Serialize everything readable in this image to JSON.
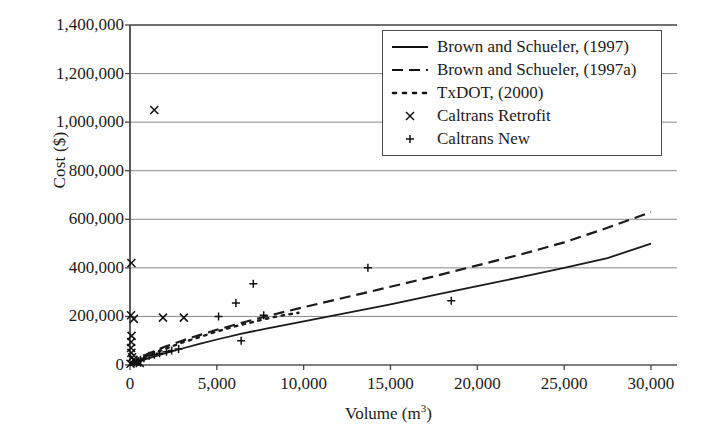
{
  "chart_data": {
    "type": "scatter",
    "title": "",
    "xlabel": "Volume (m3)",
    "xlabel_base": "Volume (m",
    "xlabel_sup": "3",
    "xlabel_tail": ")",
    "ylabel": "Cost ($)",
    "xlim": [
      0,
      31500
    ],
    "ylim": [
      0,
      1400000
    ],
    "grid": "horizontal",
    "xticks": [
      0,
      5000,
      10000,
      15000,
      20000,
      25000,
      30000
    ],
    "xticklabels": [
      "0",
      "5,000",
      "10,000",
      "15,000",
      "20,000",
      "25,000",
      "30,000"
    ],
    "yticks": [
      0,
      200000,
      400000,
      600000,
      800000,
      1000000,
      1200000,
      1400000
    ],
    "yticklabels": [
      "0",
      "200,000",
      "400,000",
      "600,000",
      "800,000",
      "1,000,000",
      "1,200,000",
      "1,400,000"
    ],
    "legend_position": "upper right",
    "legend_entries": [
      {
        "label": "Brown and Schueler, (1997)",
        "style": "solid"
      },
      {
        "label": "Brown and Schueler, (1997a)",
        "style": "dashed"
      },
      {
        "label": "TxDOT, (2000)",
        "style": "dotted"
      },
      {
        "label": "Caltrans Retrofit",
        "style": "marker-x"
      },
      {
        "label": "Caltrans New",
        "style": "marker-plus"
      }
    ],
    "series": [
      {
        "name": "Brown and Schueler, (1997)",
        "style": "solid",
        "type": "line",
        "points": [
          [
            0,
            0
          ],
          [
            500,
            14000
          ],
          [
            1000,
            26000
          ],
          [
            2000,
            48000
          ],
          [
            3000,
            68000
          ],
          [
            4000,
            87000
          ],
          [
            5000,
            105000
          ],
          [
            6500,
            130000
          ],
          [
            8000,
            152000
          ],
          [
            10000,
            180000
          ],
          [
            12500,
            215000
          ],
          [
            15000,
            250000
          ],
          [
            17500,
            288000
          ],
          [
            20000,
            325000
          ],
          [
            22500,
            362000
          ],
          [
            25000,
            400000
          ],
          [
            27500,
            440000
          ],
          [
            30000,
            500000
          ]
        ]
      },
      {
        "name": "Brown and Schueler, (1997a)",
        "style": "dashed",
        "type": "line",
        "points": [
          [
            0,
            0
          ],
          [
            500,
            26000
          ],
          [
            1000,
            45000
          ],
          [
            2000,
            75000
          ],
          [
            3000,
            100000
          ],
          [
            4000,
            123000
          ],
          [
            5000,
            145000
          ],
          [
            6500,
            175000
          ],
          [
            8000,
            203000
          ],
          [
            10000,
            238000
          ],
          [
            12500,
            280000
          ],
          [
            15000,
            322000
          ],
          [
            17500,
            365000
          ],
          [
            20000,
            410000
          ],
          [
            22500,
            455000
          ],
          [
            25000,
            505000
          ],
          [
            27500,
            565000
          ],
          [
            30000,
            630000
          ]
        ]
      },
      {
        "name": "TxDOT, (2000)",
        "style": "dotted",
        "type": "line",
        "points": [
          [
            0,
            0
          ],
          [
            500,
            20000
          ],
          [
            1000,
            38000
          ],
          [
            2000,
            66000
          ],
          [
            3000,
            92000
          ],
          [
            4000,
            115000
          ],
          [
            5000,
            138000
          ],
          [
            6000,
            158000
          ],
          [
            7000,
            176000
          ],
          [
            8000,
            193000
          ],
          [
            9000,
            207000
          ],
          [
            9700,
            215000
          ]
        ]
      },
      {
        "name": "Caltrans Retrofit",
        "style": "marker-x",
        "type": "scatter",
        "points": [
          [
            1400,
            1050000
          ],
          [
            80,
            420000
          ],
          [
            60,
            205000
          ],
          [
            220,
            190000
          ],
          [
            1900,
            195000
          ],
          [
            3100,
            195000
          ],
          [
            90,
            120000
          ],
          [
            70,
            95000
          ],
          [
            60,
            70000
          ],
          [
            80,
            50000
          ],
          [
            120,
            32000
          ],
          [
            200,
            22000
          ],
          [
            300,
            15000
          ],
          [
            420,
            10000
          ],
          [
            560,
            8000
          ],
          [
            30,
            5000
          ]
        ]
      },
      {
        "name": "Caltrans New",
        "style": "marker-plus",
        "type": "scatter",
        "points": [
          [
            5100,
            200000
          ],
          [
            6100,
            255000
          ],
          [
            7100,
            335000
          ],
          [
            6400,
            100000
          ],
          [
            13700,
            400000
          ],
          [
            18500,
            265000
          ],
          [
            7700,
            205000
          ],
          [
            1100,
            38000
          ],
          [
            1400,
            42000
          ],
          [
            1700,
            48000
          ],
          [
            2100,
            55000
          ],
          [
            2400,
            60000
          ],
          [
            2800,
            66000
          ],
          [
            600,
            22000
          ],
          [
            800,
            28000
          ],
          [
            400,
            16000
          ],
          [
            250,
            11000
          ]
        ]
      }
    ]
  }
}
